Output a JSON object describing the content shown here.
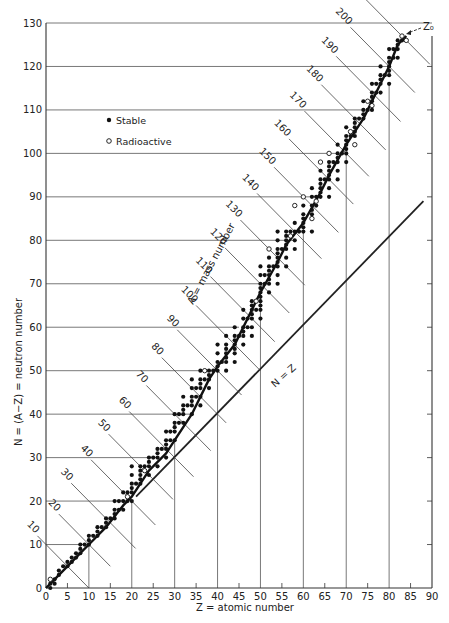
{
  "chart_data": {
    "type": "scatter",
    "title": "",
    "xlabel": "Z = atomic number",
    "ylabel": "N = (A−Z) = neutron number",
    "xlim": [
      0,
      90
    ],
    "ylim": [
      0,
      130
    ],
    "xticks": [
      0,
      5,
      10,
      15,
      20,
      25,
      30,
      35,
      40,
      45,
      50,
      55,
      60,
      65,
      70,
      75,
      80,
      85,
      90
    ],
    "yticks": [
      0,
      10,
      20,
      30,
      40,
      50,
      60,
      70,
      80,
      90,
      100,
      110,
      120,
      130
    ],
    "legend": [
      {
        "marker": "filled-circle",
        "label": "Stable"
      },
      {
        "marker": "open-circle",
        "label": "Radioactive"
      }
    ],
    "legend_position": "upper-left",
    "annotations": {
      "mass_number_label": "A = mass number",
      "n_equals_z_label": "N = Z",
      "z0_label": "Z₀"
    },
    "n_equals_z_line": {
      "from": [
        21,
        21
      ],
      "to": [
        88,
        89
      ]
    },
    "stability_curve": [
      [
        0,
        0
      ],
      [
        2,
        2
      ],
      [
        5,
        5
      ],
      [
        8,
        8
      ],
      [
        10,
        10
      ],
      [
        14,
        14
      ],
      [
        18,
        19
      ],
      [
        20,
        21
      ],
      [
        24,
        27
      ],
      [
        28,
        31
      ],
      [
        30,
        34
      ],
      [
        34,
        40
      ],
      [
        38,
        48
      ],
      [
        40,
        51
      ],
      [
        44,
        56
      ],
      [
        48,
        64
      ],
      [
        50,
        68
      ],
      [
        54,
        75
      ],
      [
        56,
        79
      ],
      [
        60,
        84
      ],
      [
        64,
        91
      ],
      [
        66,
        95
      ],
      [
        70,
        102
      ],
      [
        74,
        108
      ],
      [
        78,
        116
      ],
      [
        80,
        120
      ],
      [
        82,
        125
      ],
      [
        84,
        127
      ]
    ],
    "isobars": [
      {
        "A": 10,
        "label": "10"
      },
      {
        "A": 20,
        "label": "20"
      },
      {
        "A": 30,
        "label": "30"
      },
      {
        "A": 40,
        "label": "40"
      },
      {
        "A": 50,
        "label": "50"
      },
      {
        "A": 60,
        "label": "60"
      },
      {
        "A": 70,
        "label": "70"
      },
      {
        "A": 80,
        "label": "80"
      },
      {
        "A": 90,
        "label": "90"
      },
      {
        "A": 100,
        "label": "100"
      },
      {
        "A": 110,
        "label": "110"
      },
      {
        "A": 120,
        "label": "120"
      },
      {
        "A": 130,
        "label": "130"
      },
      {
        "A": 140,
        "label": "140"
      },
      {
        "A": 150,
        "label": "150"
      },
      {
        "A": 160,
        "label": "160"
      },
      {
        "A": 170,
        "label": "170"
      },
      {
        "A": 180,
        "label": "180"
      },
      {
        "A": 190,
        "label": "190"
      },
      {
        "A": 200,
        "label": "200"
      },
      {
        "A": 210,
        "label": "210"
      }
    ],
    "grid_horizontal": [
      {
        "N": 10,
        "to_Z": 10
      },
      {
        "N": 20,
        "to_Z": 19
      },
      {
        "N": 30,
        "to_Z": 26
      },
      {
        "N": 40,
        "to_Z": 34
      },
      {
        "N": 50,
        "to_Z": 39
      },
      {
        "N": 60,
        "to_Z": 45
      },
      {
        "N": 70,
        "to_Z": 51
      },
      {
        "N": 80,
        "to_Z": 58
      },
      {
        "N": 90,
        "to_Z": 63
      },
      {
        "N": 100,
        "to_Z": 68
      },
      {
        "N": 110,
        "to_Z": 75
      },
      {
        "N": 120,
        "to_Z": 80
      },
      {
        "N": 130,
        "to_Z": 90
      }
    ],
    "grid_vertical": [
      {
        "Z": 10,
        "to_N": 11
      },
      {
        "Z": 20,
        "to_N": 20
      },
      {
        "Z": 30,
        "to_N": 34
      },
      {
        "Z": 40,
        "to_N": 50
      },
      {
        "Z": 50,
        "to_N": 68
      },
      {
        "Z": 60,
        "to_N": 83
      },
      {
        "Z": 70,
        "to_N": 100
      },
      {
        "Z": 80,
        "to_N": 116
      }
    ],
    "stable": [
      [
        1,
        0
      ],
      [
        1,
        1
      ],
      [
        2,
        1
      ],
      [
        2,
        2
      ],
      [
        3,
        3
      ],
      [
        3,
        4
      ],
      [
        4,
        5
      ],
      [
        5,
        5
      ],
      [
        5,
        6
      ],
      [
        6,
        6
      ],
      [
        6,
        7
      ],
      [
        7,
        7
      ],
      [
        7,
        8
      ],
      [
        8,
        8
      ],
      [
        8,
        9
      ],
      [
        8,
        10
      ],
      [
        9,
        10
      ],
      [
        10,
        10
      ],
      [
        10,
        11
      ],
      [
        10,
        12
      ],
      [
        11,
        12
      ],
      [
        12,
        12
      ],
      [
        12,
        13
      ],
      [
        12,
        14
      ],
      [
        13,
        14
      ],
      [
        14,
        14
      ],
      [
        14,
        15
      ],
      [
        14,
        16
      ],
      [
        15,
        16
      ],
      [
        16,
        16
      ],
      [
        16,
        17
      ],
      [
        16,
        18
      ],
      [
        16,
        20
      ],
      [
        17,
        18
      ],
      [
        17,
        20
      ],
      [
        18,
        18
      ],
      [
        18,
        20
      ],
      [
        18,
        22
      ],
      [
        19,
        20
      ],
      [
        19,
        22
      ],
      [
        20,
        20
      ],
      [
        20,
        22
      ],
      [
        20,
        23
      ],
      [
        20,
        24
      ],
      [
        20,
        26
      ],
      [
        20,
        28
      ],
      [
        21,
        24
      ],
      [
        22,
        24
      ],
      [
        22,
        25
      ],
      [
        22,
        26
      ],
      [
        22,
        27
      ],
      [
        22,
        28
      ],
      [
        23,
        28
      ],
      [
        24,
        26
      ],
      [
        24,
        28
      ],
      [
        24,
        29
      ],
      [
        24,
        30
      ],
      [
        25,
        30
      ],
      [
        26,
        28
      ],
      [
        26,
        30
      ],
      [
        26,
        31
      ],
      [
        26,
        32
      ],
      [
        27,
        32
      ],
      [
        28,
        30
      ],
      [
        28,
        32
      ],
      [
        28,
        33
      ],
      [
        28,
        34
      ],
      [
        28,
        36
      ],
      [
        29,
        34
      ],
      [
        29,
        36
      ],
      [
        30,
        34
      ],
      [
        30,
        36
      ],
      [
        30,
        37
      ],
      [
        30,
        38
      ],
      [
        30,
        40
      ],
      [
        31,
        38
      ],
      [
        31,
        40
      ],
      [
        32,
        38
      ],
      [
        32,
        40
      ],
      [
        32,
        41
      ],
      [
        32,
        42
      ],
      [
        32,
        44
      ],
      [
        33,
        42
      ],
      [
        34,
        40
      ],
      [
        34,
        42
      ],
      [
        34,
        43
      ],
      [
        34,
        44
      ],
      [
        34,
        46
      ],
      [
        34,
        48
      ],
      [
        35,
        44
      ],
      [
        35,
        46
      ],
      [
        36,
        42
      ],
      [
        36,
        44
      ],
      [
        36,
        46
      ],
      [
        36,
        47
      ],
      [
        36,
        48
      ],
      [
        36,
        50
      ],
      [
        37,
        48
      ],
      [
        38,
        46
      ],
      [
        38,
        48
      ],
      [
        38,
        49
      ],
      [
        38,
        50
      ],
      [
        39,
        50
      ],
      [
        40,
        50
      ],
      [
        40,
        51
      ],
      [
        40,
        52
      ],
      [
        40,
        54
      ],
      [
        40,
        56
      ],
      [
        41,
        52
      ],
      [
        42,
        50
      ],
      [
        42,
        52
      ],
      [
        42,
        53
      ],
      [
        42,
        54
      ],
      [
        42,
        55
      ],
      [
        42,
        56
      ],
      [
        42,
        58
      ],
      [
        44,
        52
      ],
      [
        44,
        54
      ],
      [
        44,
        55
      ],
      [
        44,
        56
      ],
      [
        44,
        57
      ],
      [
        44,
        58
      ],
      [
        44,
        60
      ],
      [
        45,
        58
      ],
      [
        46,
        56
      ],
      [
        46,
        58
      ],
      [
        46,
        59
      ],
      [
        46,
        60
      ],
      [
        46,
        62
      ],
      [
        46,
        64
      ],
      [
        47,
        60
      ],
      [
        47,
        62
      ],
      [
        48,
        58
      ],
      [
        48,
        60
      ],
      [
        48,
        62
      ],
      [
        48,
        63
      ],
      [
        48,
        64
      ],
      [
        48,
        65
      ],
      [
        48,
        66
      ],
      [
        49,
        64
      ],
      [
        50,
        62
      ],
      [
        50,
        64
      ],
      [
        50,
        65
      ],
      [
        50,
        66
      ],
      [
        50,
        67
      ],
      [
        50,
        68
      ],
      [
        50,
        69
      ],
      [
        50,
        70
      ],
      [
        50,
        72
      ],
      [
        50,
        74
      ],
      [
        51,
        70
      ],
      [
        51,
        72
      ],
      [
        52,
        68
      ],
      [
        52,
        70
      ],
      [
        52,
        71
      ],
      [
        52,
        72
      ],
      [
        52,
        73
      ],
      [
        52,
        74
      ],
      [
        52,
        76
      ],
      [
        53,
        74
      ],
      [
        54,
        70
      ],
      [
        54,
        72
      ],
      [
        54,
        74
      ],
      [
        54,
        75
      ],
      [
        54,
        76
      ],
      [
        54,
        77
      ],
      [
        54,
        78
      ],
      [
        54,
        80
      ],
      [
        54,
        82
      ],
      [
        55,
        78
      ],
      [
        56,
        74
      ],
      [
        56,
        76
      ],
      [
        56,
        78
      ],
      [
        56,
        79
      ],
      [
        56,
        80
      ],
      [
        56,
        81
      ],
      [
        56,
        82
      ],
      [
        57,
        82
      ],
      [
        58,
        78
      ],
      [
        58,
        80
      ],
      [
        58,
        82
      ],
      [
        58,
        84
      ],
      [
        59,
        82
      ],
      [
        60,
        82
      ],
      [
        60,
        83
      ],
      [
        60,
        84
      ],
      [
        60,
        85
      ],
      [
        60,
        86
      ],
      [
        60,
        88
      ],
      [
        62,
        82
      ],
      [
        62,
        86
      ],
      [
        62,
        87
      ],
      [
        62,
        88
      ],
      [
        62,
        90
      ],
      [
        62,
        92
      ],
      [
        63,
        88
      ],
      [
        63,
        90
      ],
      [
        64,
        90
      ],
      [
        64,
        91
      ],
      [
        64,
        92
      ],
      [
        64,
        93
      ],
      [
        64,
        94
      ],
      [
        64,
        96
      ],
      [
        65,
        94
      ],
      [
        66,
        90
      ],
      [
        66,
        92
      ],
      [
        66,
        94
      ],
      [
        66,
        95
      ],
      [
        66,
        96
      ],
      [
        66,
        97
      ],
      [
        66,
        98
      ],
      [
        67,
        98
      ],
      [
        68,
        94
      ],
      [
        68,
        96
      ],
      [
        68,
        98
      ],
      [
        68,
        99
      ],
      [
        68,
        100
      ],
      [
        68,
        102
      ],
      [
        69,
        100
      ],
      [
        70,
        98
      ],
      [
        70,
        100
      ],
      [
        70,
        101
      ],
      [
        70,
        102
      ],
      [
        70,
        103
      ],
      [
        70,
        104
      ],
      [
        70,
        106
      ],
      [
        71,
        104
      ],
      [
        72,
        104
      ],
      [
        72,
        105
      ],
      [
        72,
        106
      ],
      [
        72,
        107
      ],
      [
        72,
        108
      ],
      [
        73,
        108
      ],
      [
        74,
        108
      ],
      [
        74,
        109
      ],
      [
        74,
        110
      ],
      [
        74,
        112
      ],
      [
        75,
        110
      ],
      [
        76,
        110
      ],
      [
        76,
        112
      ],
      [
        76,
        113
      ],
      [
        76,
        114
      ],
      [
        76,
        116
      ],
      [
        77,
        114
      ],
      [
        77,
        116
      ],
      [
        78,
        114
      ],
      [
        78,
        116
      ],
      [
        78,
        117
      ],
      [
        78,
        118
      ],
      [
        78,
        120
      ],
      [
        79,
        118
      ],
      [
        80,
        116
      ],
      [
        80,
        118
      ],
      [
        80,
        119
      ],
      [
        80,
        120
      ],
      [
        80,
        121
      ],
      [
        80,
        122
      ],
      [
        80,
        124
      ],
      [
        81,
        122
      ],
      [
        81,
        124
      ],
      [
        82,
        122
      ],
      [
        82,
        124
      ],
      [
        82,
        125
      ],
      [
        82,
        126
      ],
      [
        83,
        126
      ]
    ],
    "radioactive": [
      [
        1,
        2
      ],
      [
        19,
        21
      ],
      [
        23,
        27
      ],
      [
        37,
        50
      ],
      [
        49,
        66
      ],
      [
        52,
        78
      ],
      [
        57,
        81
      ],
      [
        60,
        90
      ],
      [
        62,
        85
      ],
      [
        63,
        89
      ],
      [
        71,
        105
      ],
      [
        75,
        112
      ],
      [
        76,
        111
      ],
      [
        72,
        102
      ],
      [
        84,
        126
      ],
      [
        83,
        127
      ],
      [
        58,
        88
      ],
      [
        64,
        98
      ],
      [
        66,
        100
      ]
    ]
  },
  "axes": {
    "x_title": "Z = atomic number",
    "y_title": "N = (A−Z) = neutron number"
  },
  "legend": {
    "stable": "Stable",
    "radioactive": "Radioactive"
  }
}
